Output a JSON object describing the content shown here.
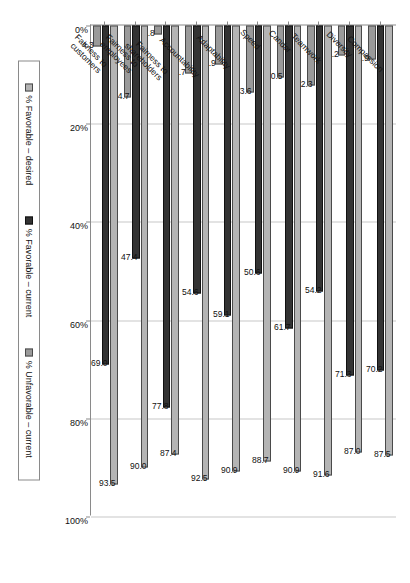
{
  "chart_data": {
    "type": "bar",
    "orientation": "horizontal",
    "title": "",
    "xlabel": "",
    "ylabel": "",
    "grid": true,
    "legend_position": "bottom",
    "axis": {
      "ticks": [
        "0%",
        "20%",
        "40%",
        "60%",
        "80%",
        "100%"
      ],
      "tick_values": [
        0,
        20,
        40,
        60,
        80,
        100
      ],
      "lim": [
        0,
        100
      ]
    },
    "categories": [
      "Compassion",
      "Diversity",
      "Teamwork",
      "Candor",
      "Speed",
      "Adaptability",
      "Accountability",
      "Fairness to shareholders",
      "Fairness to employees",
      "Fairness to customers"
    ],
    "category_lines": [
      [
        "Compassion"
      ],
      [
        "Diversity"
      ],
      [
        "Teamwork"
      ],
      [
        "Candor"
      ],
      [
        "Speed"
      ],
      [
        "Adaptability"
      ],
      [
        "Accountability"
      ],
      [
        "Fairness to",
        "shareholders"
      ],
      [
        "Fairness to",
        "employees"
      ],
      [
        "Fairness to",
        "customers"
      ]
    ],
    "series": [
      {
        "name": "% Favorable – desired",
        "color": "#b4b4b4",
        "values": [
          87.5,
          87.0,
          91.6,
          90.9,
          88.7,
          90.9,
          92.5,
          87.4,
          90.0,
          93.5
        ],
        "labels": [
          "87.5",
          "87.0",
          "91.6",
          "90.9",
          "88.7",
          "90.9",
          "92.5",
          "87.4",
          "90.0",
          "93.5"
        ]
      },
      {
        "name": "% Favorable – current",
        "color": "#333333",
        "values": [
          70.2,
          71.3,
          54.2,
          61.7,
          50.6,
          59.1,
          54.6,
          77.8,
          47.4,
          69.0
        ],
        "labels": [
          "70.2",
          "71.3",
          "54.2",
          "61.7",
          "50.6",
          "59.1",
          "54.6",
          "77.8",
          "47.4",
          "69.0"
        ]
      },
      {
        "name": "% Unfavorable – current",
        "color": "#9a9a9a",
        "values": [
          6.9,
          6.2,
          12.3,
          10.5,
          13.6,
          7.9,
          9.7,
          1.8,
          14.7,
          4.3
        ],
        "labels": [
          "6.9",
          "6.2",
          "12.3",
          "10.5",
          "13.6",
          "7.9",
          "9.7",
          "1.8",
          "14.7",
          "4.3"
        ]
      }
    ]
  },
  "legend": {
    "items": [
      {
        "label": "% Favorable – desired"
      },
      {
        "label": "% Favorable – current"
      },
      {
        "label": "% Unfavorable – current"
      }
    ]
  }
}
